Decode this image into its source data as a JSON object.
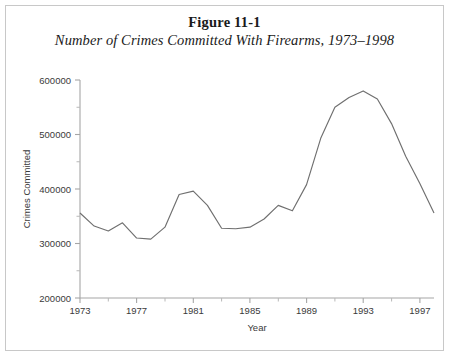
{
  "figure": {
    "number_label": "Figure 11-1",
    "caption": "Number of Crimes Committed With Firearms, 1973–1998"
  },
  "colors": {
    "background": "#ffffff",
    "frame_border": "#c8c8c8",
    "axis": "#a6a6a6",
    "line": "#6f6f6f",
    "text": "#3a3a3a"
  },
  "axes": {
    "y_title": "Crimes Committed",
    "x_title": "Year",
    "y_tick_labels": [
      "600000",
      "500000",
      "400000",
      "300000",
      "200000"
    ],
    "x_tick_labels": [
      "1973",
      "1977",
      "1981",
      "1985",
      "1989",
      "1993",
      "1997"
    ]
  },
  "chart_data": {
    "type": "line",
    "title": "Number of Crimes Committed With Firearms, 1973–1998",
    "xlabel": "Year",
    "ylabel": "Crimes Committed",
    "xlim": [
      1973,
      1998
    ],
    "ylim": [
      200000,
      600000
    ],
    "y_ticks": [
      200000,
      300000,
      400000,
      500000,
      600000
    ],
    "y_minor_ticks": [
      250000,
      350000,
      450000,
      550000
    ],
    "x_ticks": [
      1973,
      1977,
      1981,
      1985,
      1989,
      1993,
      1997
    ],
    "x_minor_ticks": [
      1975,
      1979,
      1983,
      1987,
      1991,
      1995
    ],
    "grid": false,
    "legend": false,
    "x": [
      1973,
      1974,
      1975,
      1976,
      1977,
      1978,
      1979,
      1980,
      1981,
      1982,
      1983,
      1984,
      1985,
      1986,
      1987,
      1988,
      1989,
      1990,
      1991,
      1992,
      1993,
      1994,
      1995,
      1996,
      1997,
      1998
    ],
    "values": [
      356000,
      332000,
      323000,
      338000,
      310000,
      308000,
      330000,
      390000,
      396000,
      370000,
      328000,
      327000,
      330000,
      345000,
      370000,
      360000,
      408000,
      493000,
      550000,
      568000,
      580000,
      565000,
      520000,
      460000,
      410000,
      356000
    ],
    "series": [
      {
        "name": "Crimes committed with firearms",
        "values": [
          356000,
          332000,
          323000,
          338000,
          310000,
          308000,
          330000,
          390000,
          396000,
          370000,
          328000,
          327000,
          330000,
          345000,
          370000,
          360000,
          408000,
          493000,
          550000,
          568000,
          580000,
          565000,
          520000,
          460000,
          410000,
          356000
        ]
      }
    ],
    "annotations": []
  }
}
